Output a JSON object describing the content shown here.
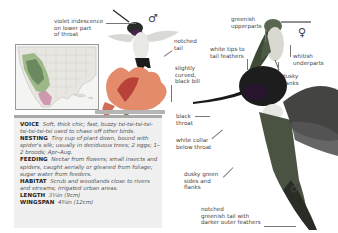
{
  "labels": {
    "violet": "violet iridescence\non lower part\nof throat",
    "violet_l1": "violet iridescence",
    "violet_l2": "on lower part",
    "violet_l3": "of throat",
    "notched_tail_l1": "notched",
    "notched_tail_l2": "tail",
    "bill_l1": "slightly",
    "bill_l2": "curved,",
    "bill_l3": "black bill",
    "greenish_l1": "greenish",
    "greenish_l2": "upperparts",
    "whitetips_l1": "white tips to",
    "whitetips_l2": "tail feathers",
    "whitish_l1": "whitish",
    "whitish_l2": "underparts",
    "dusky_flanks_l1": "dusky",
    "dusky_flanks_l2": "flanks",
    "black_throat_l1": "black",
    "black_throat_l2": "throat",
    "collar_l1": "white collar",
    "collar_l2": "below throat",
    "dusky_green_l1": "dusky green",
    "dusky_green_l2": "sides and",
    "dusky_green_l3": "flanks",
    "tail_l1": "notched",
    "tail_l2": "greenish tail with",
    "tail_l3": "darker outer feathers"
  },
  "symbols": {
    "male_top": "♂",
    "female": "♀",
    "male_main": "♂"
  },
  "info": {
    "voice_label": "VOICE",
    "voice_text": "Soft, thick chic; fast, buzzy tsi-tsi-tsi-tsi-tsi-tsi-tsi-tsi used to chase off other birds.",
    "nesting_label": "NESTING",
    "nesting_text": "Tiny cup of plant down, bound with spider's silk; usually in deciduous trees; 2 eggs; 1–2 broods; Apr–Aug.",
    "feeding_label": "FEEDING",
    "feeding_text": "Nectar from flowers; small insects and spiders, caught aerially or gleaned from foliage; sugar water from feeders.",
    "habitat_label": "HABITAT",
    "habitat_text": "Scrub and woodlands close to rivers and streams; irrigated urban areas.",
    "length_label": "LENGTH",
    "length_text": "3¼in (9cm)",
    "wingspan_label": "WINGSPAN",
    "wingspan_text": "4¾in (12cm)"
  },
  "colors": {
    "info_bg": "#f0f0f0",
    "info_bar": "#a9a9a9",
    "range_breeding": "#8fb07a",
    "range_winter": "#c98aa8"
  }
}
